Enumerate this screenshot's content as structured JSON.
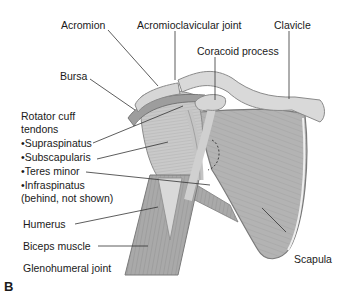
{
  "figure": {
    "panel_letter": "B",
    "labels": {
      "acromion": "Acromion",
      "acromioclavicular_joint": "Acromioclavicular joint",
      "clavicle": "Clavicle",
      "coracoid_process": "Coracoid process",
      "bursa": "Bursa",
      "rotator_cuff_line1": "Rotator cuff",
      "rotator_cuff_line2": "tendons",
      "supraspinatus": "•Supraspinatus",
      "subscapularis": "•Subscapularis",
      "teres_minor": "•Teres minor",
      "infraspinatus": "•Infraspinatus",
      "infraspinatus_note": "(behind, not shown)",
      "humerus": "Humerus",
      "biceps_muscle": "Biceps muscle",
      "glenohumeral_joint": "Glenohumeral joint",
      "scapula": "Scapula"
    },
    "colors": {
      "bone": "#d6d6d6",
      "bone_edge": "#8a8a8a",
      "muscle": "#a9a9a9",
      "tendon": "#c4c4c4",
      "bursa": "#9a9a9a",
      "leader": "#333333"
    }
  }
}
